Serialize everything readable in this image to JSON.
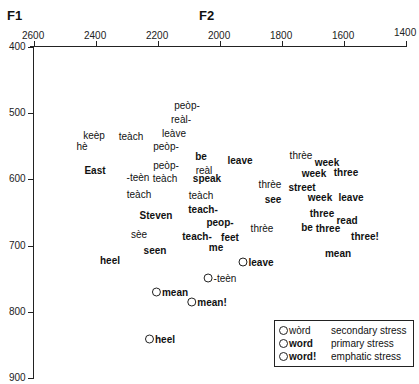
{
  "chart_data": {
    "type": "scatter",
    "title": "",
    "xlabel": "F2",
    "ylabel": "F1",
    "xlim": [
      2600,
      1400
    ],
    "ylim": [
      400,
      900
    ],
    "x_inverted": true,
    "y_inverted": true,
    "grid": false,
    "xticks": [
      "2600",
      "2400",
      "2200",
      "2000",
      "1800",
      "1600",
      "1400"
    ],
    "yticks": [
      "400",
      "500",
      "600",
      "700",
      "800",
      "900"
    ],
    "legend": [
      {
        "sample": "wòrd",
        "style": "secondary",
        "desc": "secondary stress"
      },
      {
        "sample": "word",
        "style": "primary",
        "desc": "primary stress"
      },
      {
        "sample": "word!",
        "style": "emphatic",
        "desc": "emphatic stress"
      }
    ],
    "legend_position": "lower right",
    "points": [
      {
        "label": "peòp-",
        "stress": "secondary",
        "circled": false,
        "F2": 2190,
        "F1": 508,
        "px": [
          187,
          105
        ]
      },
      {
        "label": "reàl-",
        "stress": "secondary",
        "circled": false,
        "F2": 2210,
        "F1": 528,
        "px": [
          181,
          119
        ]
      },
      {
        "label": "keèp",
        "stress": "secondary",
        "circled": false,
        "F2": 2460,
        "F1": 541,
        "px": [
          94,
          135
        ]
      },
      {
        "label": "hè",
        "stress": "secondary",
        "circled": false,
        "F2": 2480,
        "F1": 555,
        "px": [
          82,
          146
        ]
      },
      {
        "label": "teàch",
        "stress": "secondary",
        "circled": false,
        "F2": 2310,
        "F1": 542,
        "px": [
          131,
          136
        ]
      },
      {
        "label": "leàve",
        "stress": "secondary",
        "circled": false,
        "F2": 2150,
        "F1": 538,
        "px": [
          174,
          133
        ]
      },
      {
        "label": "peòp-",
        "stress": "secondary",
        "circled": false,
        "F2": 2180,
        "F1": 557,
        "px": [
          166,
          146
        ]
      },
      {
        "label": "East",
        "stress": "primary",
        "circled": false,
        "F2": 2420,
        "F1": 585,
        "px": [
          95,
          170
        ]
      },
      {
        "label": "-teèn",
        "stress": "secondary",
        "circled": false,
        "F2": 2270,
        "F1": 593,
        "px": [
          138,
          177
        ]
      },
      {
        "label": "peòp-",
        "stress": "secondary",
        "circled": false,
        "F2": 2180,
        "F1": 580,
        "px": [
          166,
          165
        ]
      },
      {
        "label": "teàch",
        "stress": "secondary",
        "circled": false,
        "F2": 2170,
        "F1": 597,
        "px": [
          165,
          178
        ]
      },
      {
        "label": "be",
        "stress": "primary",
        "circled": false,
        "F2": 2110,
        "F1": 568,
        "px": [
          201,
          156
        ]
      },
      {
        "label": "reàl",
        "stress": "secondary",
        "circled": false,
        "F2": 2090,
        "F1": 585,
        "px": [
          204,
          170
        ]
      },
      {
        "label": "speak",
        "stress": "primary",
        "circled": false,
        "F2": 2080,
        "F1": 597,
        "px": [
          207,
          178
        ]
      },
      {
        "label": "leave",
        "stress": "primary",
        "circled": false,
        "F2": 1980,
        "F1": 572,
        "px": [
          240,
          160
        ]
      },
      {
        "label": "thrèe",
        "stress": "secondary",
        "circled": false,
        "F2": 1880,
        "F1": 609,
        "px": [
          270,
          184
        ]
      },
      {
        "label": "see",
        "stress": "primary",
        "circled": false,
        "F2": 1820,
        "F1": 631,
        "px": [
          273,
          199
        ]
      },
      {
        "label": "teàch",
        "stress": "secondary",
        "circled": false,
        "F2": 2270,
        "F1": 622,
        "px": [
          139,
          194
        ]
      },
      {
        "label": "teàch",
        "stress": "secondary",
        "circled": false,
        "F2": 2090,
        "F1": 624,
        "px": [
          201,
          195
        ]
      },
      {
        "label": "Steven",
        "stress": "primary",
        "circled": false,
        "F2": 2300,
        "F1": 653,
        "px": [
          156,
          215
        ]
      },
      {
        "label": "teach-",
        "stress": "primary",
        "circled": false,
        "F2": 2090,
        "F1": 644,
        "px": [
          203,
          209
        ]
      },
      {
        "label": "peop-",
        "stress": "primary",
        "circled": false,
        "F2": 1990,
        "F1": 669,
        "px": [
          220,
          222
        ]
      },
      {
        "label": "sèe",
        "stress": "secondary",
        "circled": false,
        "F2": 2250,
        "F1": 689,
        "px": [
          139,
          234
        ]
      },
      {
        "label": "teach-",
        "stress": "primary",
        "circled": false,
        "F2": 2090,
        "F1": 692,
        "px": [
          197,
          236
        ]
      },
      {
        "label": "feet",
        "stress": "primary",
        "circled": false,
        "F2": 1950,
        "F1": 693,
        "px": [
          230,
          237
        ]
      },
      {
        "label": "thrèe",
        "stress": "secondary",
        "circled": false,
        "F2": 1840,
        "F1": 679,
        "px": [
          262,
          228
        ]
      },
      {
        "label": "seen",
        "stress": "primary",
        "circled": false,
        "F2": 2190,
        "F1": 715,
        "px": [
          155,
          250
        ]
      },
      {
        "label": "me",
        "stress": "primary",
        "circled": false,
        "F2": 2050,
        "F1": 707,
        "px": [
          216,
          247
        ]
      },
      {
        "label": "heel",
        "stress": "primary",
        "circled": false,
        "F2": 2500,
        "F1": 724,
        "px": [
          110,
          260
        ]
      },
      {
        "label": "thrèe",
        "stress": "secondary",
        "circled": false,
        "F2": 1790,
        "F1": 570,
        "px": [
          301,
          155
        ]
      },
      {
        "label": "week",
        "stress": "primary",
        "circled": false,
        "F2": 1720,
        "F1": 579,
        "px": [
          327,
          162
        ]
      },
      {
        "label": "week",
        "stress": "primary",
        "circled": false,
        "F2": 1760,
        "F1": 597,
        "px": [
          314,
          173
        ]
      },
      {
        "label": "three",
        "stress": "primary",
        "circled": false,
        "F2": 1640,
        "F1": 590,
        "px": [
          346,
          172
        ]
      },
      {
        "label": "street",
        "stress": "primary",
        "circled": false,
        "F2": 1790,
        "F1": 620,
        "px": [
          302,
          187
        ]
      },
      {
        "label": "week",
        "stress": "primary",
        "circled": false,
        "F2": 1720,
        "F1": 637,
        "px": [
          320,
          197
        ]
      },
      {
        "label": "leave",
        "stress": "primary",
        "circled": false,
        "F2": 1640,
        "F1": 630,
        "px": [
          351,
          197
        ]
      },
      {
        "label": "three",
        "stress": "primary",
        "circled": false,
        "F2": 1680,
        "F1": 660,
        "px": [
          322,
          213
        ]
      },
      {
        "label": "read",
        "stress": "primary",
        "circled": false,
        "F2": 1620,
        "F1": 680,
        "px": [
          347,
          220
        ]
      },
      {
        "label": "be",
        "stress": "primary",
        "circled": false,
        "F2": 1760,
        "F1": 687,
        "px": [
          307,
          227
        ]
      },
      {
        "label": "three",
        "stress": "primary",
        "circled": false,
        "F2": 1720,
        "F1": 692,
        "px": [
          328,
          228
        ]
      },
      {
        "label": "three!",
        "stress": "emphatic",
        "circled": false,
        "F2": 1580,
        "F1": 712,
        "px": [
          365,
          236
        ]
      },
      {
        "label": "mean",
        "stress": "primary",
        "circled": false,
        "F2": 1620,
        "F1": 718,
        "px": [
          338,
          253
        ]
      },
      {
        "label": "leave",
        "stress": "primary",
        "circled": true,
        "F2": 1950,
        "F1": 725,
        "px": [
          256,
          262
        ]
      },
      {
        "label": "-teèn",
        "stress": "secondary",
        "circled": true,
        "F2": 1990,
        "F1": 747,
        "px": [
          220,
          278
        ]
      },
      {
        "label": "mean",
        "stress": "primary",
        "circled": true,
        "F2": 2150,
        "F1": 772,
        "px": [
          170,
          292
        ]
      },
      {
        "label": "mean!",
        "stress": "emphatic",
        "circled": true,
        "F2": 2040,
        "F1": 785,
        "px": [
          207,
          302
        ]
      },
      {
        "label": "heel",
        "stress": "primary",
        "circled": true,
        "F2": 2170,
        "F1": 841,
        "px": [
          160,
          339
        ]
      }
    ]
  }
}
